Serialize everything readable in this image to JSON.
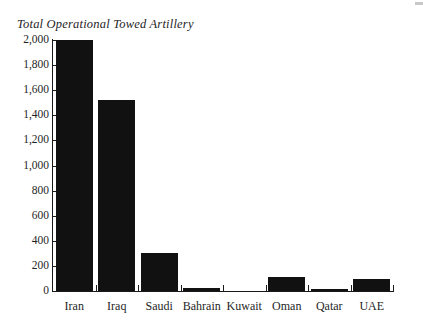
{
  "chart_data": {
    "type": "bar",
    "title": "Total Operational Towed Artillery",
    "xlabel": "",
    "ylabel": "",
    "categories": [
      "Iran",
      "Iraq",
      "Saudi",
      "Bahrain",
      "Kuwait",
      "Oman",
      "Qatar",
      "UAE"
    ],
    "values": [
      2000,
      1520,
      300,
      26,
      0,
      108,
      14,
      93
    ],
    "ylim": [
      0,
      2000
    ],
    "yticks": [
      0,
      200,
      400,
      600,
      800,
      1000,
      1200,
      1400,
      1600,
      1800,
      2000
    ],
    "ytick_labels": [
      "0",
      "200",
      "400",
      "600",
      "800",
      "1,000",
      "1,200",
      "1,400",
      "1,600",
      "1,800",
      "2,000"
    ],
    "grid": false,
    "legend": null,
    "bar_color": "#111111",
    "axis_color": "#1a1a1a"
  }
}
